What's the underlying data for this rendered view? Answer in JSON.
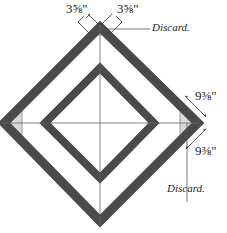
{
  "diagram": {
    "labels": {
      "top_left_dim": "3⅝\"",
      "top_right_dim": "3⅝\"",
      "top_discard": "Discard.",
      "right_upper_dim": "9⅜\"",
      "right_lower_dim": "9⅜\"",
      "bottom_discard": "Discard."
    },
    "colors": {
      "strip": "#4a4a4a",
      "triangle": "#d6d6d6",
      "line": "#555555",
      "background": "#ffffff"
    }
  }
}
